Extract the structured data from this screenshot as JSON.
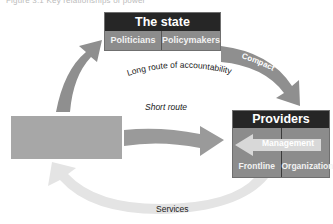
{
  "caption": "Figure 3.1  Key relationships of power",
  "state": {
    "title": "The state",
    "cells": [
      "Politicians",
      "Policymakers"
    ]
  },
  "providers": {
    "title": "Providers",
    "management": "Management",
    "cells": [
      "Frontline",
      "Organizations"
    ]
  },
  "client": {
    "label": ""
  },
  "arrows": {
    "long_route": "Long route of accountability",
    "compact": "Compact",
    "short_route": "Short route",
    "services": "Services"
  },
  "colors": {
    "title_band": "#262626",
    "cell_gray": "#8c8c8c",
    "arrow_dark": "#8f8f8f",
    "arrow_light": "#e4e4e4",
    "client_box": "#a7a7a7",
    "management_arrow": "#d8d8d8"
  }
}
